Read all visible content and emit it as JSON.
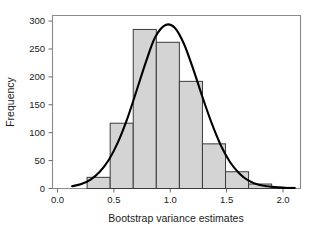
{
  "chart_data": {
    "type": "bar",
    "title": "",
    "subtitle": "",
    "xlabel": "Bootstrap variance estimates",
    "ylabel": "Frequency",
    "xlim": [
      0.0,
      2.15
    ],
    "ylim": [
      0,
      310
    ],
    "grid": false,
    "legend": false,
    "legend_position": "none",
    "bin_width": 0.2,
    "bin_edges": [
      0.3,
      0.5,
      0.7,
      0.9,
      1.1,
      1.3,
      1.5,
      1.7,
      1.9,
      2.1
    ],
    "categories": [
      "0.3-0.5",
      "0.5-0.7",
      "0.7-0.9",
      "0.9-1.1",
      "1.1-1.3",
      "1.3-1.5",
      "1.5-1.7",
      "1.7-1.9",
      "1.9-2.1"
    ],
    "bin_centers": [
      0.4,
      0.6,
      0.8,
      1.0,
      1.2,
      1.4,
      1.6,
      1.8,
      2.0
    ],
    "values": [
      20,
      117,
      285,
      262,
      192,
      80,
      30,
      8,
      2
    ],
    "xticks": [
      0.0,
      0.5,
      1.0,
      1.5,
      2.0
    ],
    "xtick_labels": [
      "0.0",
      "0.5",
      "1.0",
      "1.5",
      "2.0"
    ],
    "yticks": [
      0,
      50,
      100,
      150,
      200,
      250,
      300
    ],
    "ytick_labels": [
      "0",
      "50",
      "100",
      "150",
      "200",
      "250",
      "300"
    ],
    "series": [
      {
        "name": "Histogram",
        "type": "bar",
        "values": [
          20,
          117,
          285,
          262,
          192,
          80,
          30,
          8,
          2
        ],
        "fill_color": "#d4d4d4",
        "edge_color": "#3a3a3a"
      },
      {
        "name": "Fitted normal density curve",
        "type": "line",
        "color": "#000000",
        "peak_x": 0.98,
        "peak_y": 293,
        "x": [
          0.17,
          0.25,
          0.33,
          0.41,
          0.49,
          0.57,
          0.65,
          0.73,
          0.81,
          0.89,
          0.98,
          1.06,
          1.14,
          1.22,
          1.3,
          1.38,
          1.46,
          1.54,
          1.62,
          1.7,
          1.78,
          1.86,
          1.95,
          2.03,
          2.1
        ],
        "y": [
          4,
          8,
          16,
          30,
          52,
          84,
          126,
          176,
          227,
          271,
          293,
          288,
          259,
          214,
          164,
          117,
          77,
          47,
          27,
          14,
          7,
          4,
          2,
          1,
          1
        ]
      }
    ]
  },
  "colors": {
    "bar_fill": "#d4d4d4",
    "bar_edge": "#3a3a3a",
    "curve": "#000000",
    "frame": "#8a8a8a",
    "text": "#1a1a1a",
    "background": "#ffffff"
  }
}
